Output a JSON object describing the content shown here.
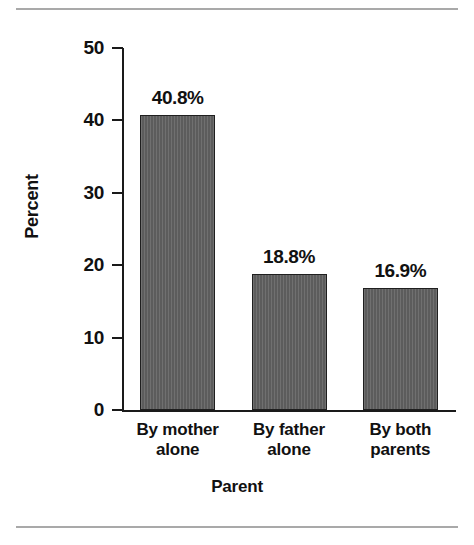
{
  "chart_data": {
    "type": "bar",
    "title": "",
    "xlabel": "Parent",
    "ylabel": "Percent",
    "categories": [
      "By mother alone",
      "By father alone",
      "By both parents"
    ],
    "category_lines": [
      [
        "By mother",
        "alone"
      ],
      [
        "By father",
        "alone"
      ],
      [
        "By both",
        "parents"
      ]
    ],
    "values": [
      40.8,
      18.8,
      16.9
    ],
    "value_labels": [
      "40.8%",
      "18.8%",
      "16.9%"
    ],
    "ylim": [
      0,
      50
    ],
    "ytick_labels": [
      "0",
      "10",
      "20",
      "30",
      "40",
      "50"
    ],
    "ytick_values": [
      0,
      10,
      20,
      30,
      40,
      50
    ],
    "grid": false,
    "legend": false,
    "legend_position": "none",
    "bar_fill_color": "#606060",
    "bar_border_color": "#1f1f1f",
    "axis_color": "#1a1a1a",
    "text_color": "#111111",
    "background_color": "#ffffff",
    "rule_color": "#a9a9a9"
  }
}
